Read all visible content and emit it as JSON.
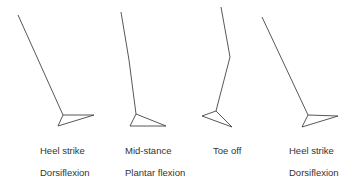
{
  "diagram": {
    "stroke_color": "#444444",
    "phases": [
      {
        "name": "Heel strike",
        "motion": "Dorsiflexion",
        "leg": [
          [
            18,
            15
          ],
          [
            63,
            115
          ]
        ],
        "foot": [
          [
            63,
            115
          ],
          [
            94,
            115
          ],
          [
            58,
            126
          ]
        ]
      },
      {
        "name": "Mid-stance",
        "motion": "Plantar flexion",
        "leg": [
          [
            121,
            12
          ],
          [
            129,
            60
          ],
          [
            136,
            114
          ]
        ],
        "foot": [
          [
            136,
            114
          ],
          [
            130,
            126
          ],
          [
            166,
            126
          ]
        ]
      },
      {
        "name": "Toe off",
        "motion": "",
        "leg": [
          [
            221,
            7
          ],
          [
            230,
            57
          ],
          [
            216,
            111
          ]
        ],
        "foot": [
          [
            216,
            111
          ],
          [
            202,
            116
          ],
          [
            232,
            127
          ]
        ]
      },
      {
        "name": "Heel strike",
        "motion": "Dorsiflexion",
        "leg": [
          [
            262,
            17
          ],
          [
            308,
            115
          ]
        ],
        "foot": [
          [
            308,
            115
          ],
          [
            338,
            116
          ],
          [
            302,
            127
          ]
        ]
      }
    ]
  }
}
